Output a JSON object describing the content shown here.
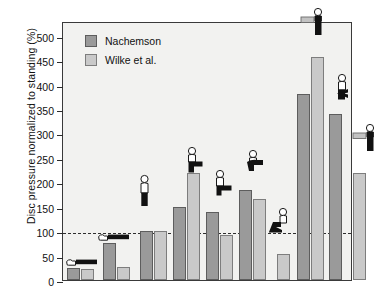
{
  "chart_data": {
    "type": "bar",
    "title": "",
    "xlabel": "",
    "ylabel": "Disc pressure normalized to standing (%)",
    "ylim": [
      0,
      530
    ],
    "yticks": [
      0,
      50,
      100,
      150,
      200,
      250,
      300,
      350,
      400,
      450,
      500
    ],
    "ytick_labels": [
      "0",
      "50",
      "100",
      "150",
      "200",
      "250",
      "300",
      "350",
      "400",
      "450",
      "500"
    ],
    "grid": false,
    "legend_position": "top-left",
    "reference_line": {
      "value": 100,
      "style": "dashed",
      "label": ""
    },
    "categories": [
      "Lying supine",
      "Lying on side",
      "Standing",
      "Standing bent forward",
      "Sitting relaxed",
      "Sitting bent forward",
      "Sitting slouched",
      "Lifting, back straight",
      "Lifting, back bent",
      "Holding weight close to body"
    ],
    "series": [
      {
        "name": "Nachemson",
        "color": "#9a9a9a",
        "values": [
          25,
          75,
          100,
          150,
          140,
          185,
          null,
          380,
          340,
          null
        ]
      },
      {
        "name": "Wilke et al.",
        "color": "#c9c9c9",
        "values": [
          22,
          27,
          100,
          220,
          93,
          166,
          53,
          457,
          null,
          218
        ]
      }
    ]
  },
  "legend": {
    "items": [
      {
        "label": "Nachemson",
        "swatch": "nachemson-swatch"
      },
      {
        "label": "Wilke et al.",
        "swatch": "wilke-swatch"
      }
    ]
  },
  "axis": {
    "y_title": "Disc pressure normalized to standing (%)",
    "ticks": [
      {
        "value": 500,
        "label": "500"
      },
      {
        "value": 450,
        "label": "450"
      },
      {
        "value": 400,
        "label": "400"
      },
      {
        "value": 350,
        "label": "350"
      },
      {
        "value": 300,
        "label": "300"
      },
      {
        "value": 250,
        "label": "250"
      },
      {
        "value": 200,
        "label": "200"
      },
      {
        "value": 150,
        "label": "150"
      },
      {
        "value": 100,
        "label": "100"
      },
      {
        "value": 50,
        "label": "50"
      },
      {
        "value": 0,
        "label": "0"
      }
    ]
  },
  "bars": [
    {
      "name": "lying-supine-nachemson",
      "series": "Nachemson",
      "value": 25,
      "x": 4,
      "w": 13
    },
    {
      "name": "lying-supine-wilke",
      "series": "Wilke et al.",
      "value": 22,
      "x": 18,
      "w": 13
    },
    {
      "name": "lying-side-nachemson",
      "series": "Nachemson",
      "value": 75,
      "x": 40,
      "w": 13
    },
    {
      "name": "lying-side-wilke",
      "series": "Wilke et al.",
      "value": 27,
      "x": 54,
      "w": 13
    },
    {
      "name": "standing-nachemson",
      "series": "Nachemson",
      "value": 100,
      "x": 77,
      "w": 13
    },
    {
      "name": "standing-wilke",
      "series": "Wilke et al.",
      "value": 100,
      "x": 91,
      "w": 13
    },
    {
      "name": "standing-bent-nachemson",
      "series": "Nachemson",
      "value": 150,
      "x": 110,
      "w": 13
    },
    {
      "name": "standing-bent-wilke",
      "series": "Wilke et al.",
      "value": 220,
      "x": 124,
      "w": 13
    },
    {
      "name": "sitting-relaxed-nachemson",
      "series": "Nachemson",
      "value": 140,
      "x": 143,
      "w": 13
    },
    {
      "name": "sitting-relaxed-wilke",
      "series": "Wilke et al.",
      "value": 93,
      "x": 157,
      "w": 13
    },
    {
      "name": "sitting-bent-nachemson",
      "series": "Nachemson",
      "value": 185,
      "x": 176,
      "w": 13
    },
    {
      "name": "sitting-bent-wilke",
      "series": "Wilke et al.",
      "value": 166,
      "x": 190,
      "w": 13
    },
    {
      "name": "sitting-slouched-wilke",
      "series": "Wilke et al.",
      "value": 53,
      "x": 214,
      "w": 13
    },
    {
      "name": "lifting-straight-nachemson",
      "series": "Nachemson",
      "value": 380,
      "x": 234,
      "w": 13
    },
    {
      "name": "lifting-straight-wilke",
      "series": "Wilke et al.",
      "value": 457,
      "x": 248,
      "w": 13
    },
    {
      "name": "lifting-bent-nachemson",
      "series": "Nachemson",
      "value": 340,
      "x": 266,
      "w": 13
    },
    {
      "name": "holding-weight-wilke",
      "series": "Wilke et al.",
      "value": 218,
      "x": 290,
      "w": 13
    }
  ],
  "pictograms": [
    {
      "name": "posture-lying-supine",
      "x": 2,
      "value": 25,
      "type": "lying"
    },
    {
      "name": "posture-lying-side",
      "x": 34,
      "value": 75,
      "type": "lying"
    },
    {
      "name": "posture-standing",
      "x": 75,
      "value": 150,
      "type": "standing"
    },
    {
      "name": "posture-standing-bent",
      "x": 120,
      "value": 220,
      "type": "bent"
    },
    {
      "name": "posture-sitting-relaxed",
      "x": 150,
      "value": 172,
      "type": "sitting"
    },
    {
      "name": "posture-sitting-bent",
      "x": 180,
      "value": 212,
      "type": "sittingbent"
    },
    {
      "name": "posture-sitting-slouched",
      "x": 205,
      "value": 95,
      "type": "slouched"
    },
    {
      "name": "posture-lifting-straight",
      "x": 238,
      "value": 500,
      "type": "desk"
    },
    {
      "name": "posture-lifting-bent",
      "x": 268,
      "value": 365,
      "type": "squat"
    },
    {
      "name": "posture-holding-weight",
      "x": 290,
      "value": 262,
      "type": "desk"
    }
  ]
}
